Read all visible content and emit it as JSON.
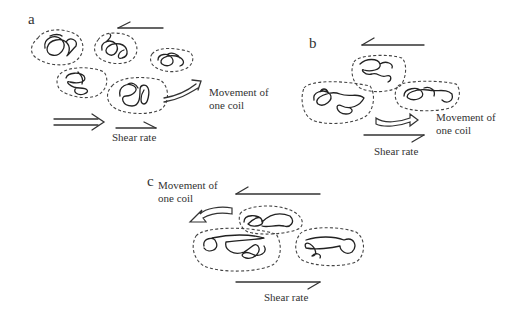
{
  "figure": {
    "panels": [
      {
        "id": "a",
        "letter": "a",
        "movement_label_line1": "Movement of",
        "movement_label_line2": "one coil",
        "shear_label": "Shear rate",
        "coil_count": 5,
        "state": "entangled coils, one coil moving to the right"
      },
      {
        "id": "b",
        "letter": "b",
        "movement_label_line1": "Movement of",
        "movement_label_line2": "one coil",
        "shear_label": "Shear rate",
        "coil_count": 3,
        "state": "coils partially stretched, coil moving right"
      },
      {
        "id": "c",
        "letter": "c",
        "movement_label_line1": "Movement of",
        "movement_label_line2": "one coil",
        "shear_label": "Shear rate",
        "coil_count": 3,
        "state": "coils elongated/aligned, coil moving left"
      }
    ]
  }
}
